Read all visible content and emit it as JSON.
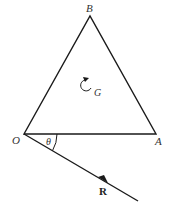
{
  "diagram": {
    "type": "triangle-with-force-vector",
    "colors": {
      "stroke": "#1a1a1a",
      "label": "#333333",
      "background": "#ffffff"
    },
    "vertices": {
      "B": {
        "label": "B",
        "x": 90,
        "y": 16
      },
      "O": {
        "label": "O",
        "x": 24,
        "y": 134
      },
      "A": {
        "label": "A",
        "x": 156,
        "y": 134
      }
    },
    "center": {
      "label": "G",
      "symbol": "counterclockwise-rotation"
    },
    "angle": {
      "label": "θ",
      "between": [
        "OA",
        "R"
      ]
    },
    "force": {
      "label": "R",
      "from": "O",
      "direction": "below OA at angle θ"
    }
  }
}
